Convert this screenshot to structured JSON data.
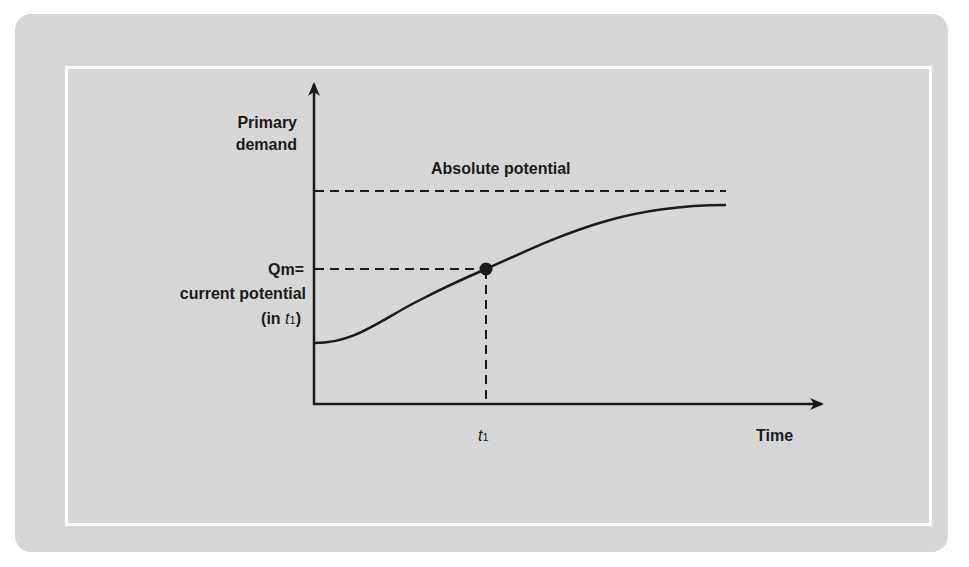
{
  "diagram": {
    "y_axis_label_line1": "Primary",
    "y_axis_label_line2": "demand",
    "x_axis_label": "Time",
    "absolute_potential_label": "Absolute potential",
    "qm_label_line1": "Qm=",
    "qm_label_line2": "current potential",
    "qm_label_line3_prefix": "(in ",
    "qm_label_line3_var": "t",
    "qm_label_line3_sub": "1",
    "qm_label_line3_suffix": ")",
    "t1_var": "t",
    "t1_sub": "1"
  },
  "colors": {
    "panel_background": "#d6d6d6",
    "frame_border": "#ffffff",
    "line": "#1a1a1a"
  }
}
